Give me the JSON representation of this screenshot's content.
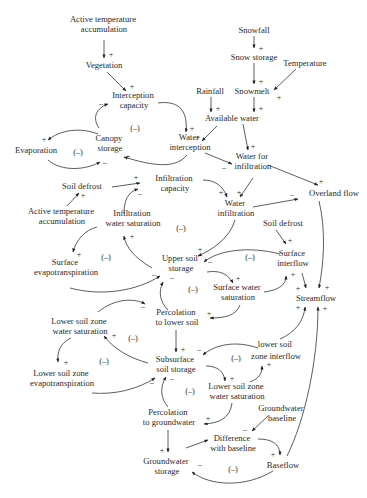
{
  "diagram": {
    "type": "causal-loop-diagram",
    "nodes": {
      "active_temp_top": [
        "Active temperature",
        "accumulation"
      ],
      "vegetation": [
        "Vegetation"
      ],
      "interception_capacity": [
        "Interception",
        "capacity"
      ],
      "snowfall": [
        "Snowfall"
      ],
      "snow_storage": [
        "Snow storage"
      ],
      "temperature": [
        "Temperature"
      ],
      "rainfall": [
        "Rainfall"
      ],
      "snowmelt": [
        "Snowmelt"
      ],
      "available_water": [
        "Available water"
      ],
      "water_interception": [
        "Water",
        "interception"
      ],
      "canopy_storage": [
        "Canopy",
        "storage"
      ],
      "evaporation": [
        "Evaporation"
      ],
      "water_for_infiltration": [
        "Water for",
        "infiltration"
      ],
      "overland_flow": [
        "Overland flow"
      ],
      "soil_defrost_left": [
        "Soil defrost"
      ],
      "infiltration_capacity": [
        "Infiltration",
        "capacity"
      ],
      "water_infiltration": [
        "Water",
        "infiltration"
      ],
      "active_temp_mid": [
        "Active temperature",
        "accumulation"
      ],
      "infiltration_water_saturation": [
        "Infiltration",
        "water saturation"
      ],
      "soil_defrost_right": [
        "Soil defrost"
      ],
      "surface_evapotranspiration": [
        "Surface",
        "evapotranspiration"
      ],
      "upper_soil_storage": [
        "Upper soil",
        "storage"
      ],
      "surface_interflow": [
        "Surface",
        "interflow"
      ],
      "surface_water_saturation": [
        "Surface water",
        "saturation"
      ],
      "streamflow": [
        "Streamflow"
      ],
      "percolation_lower_soil": [
        "Percolation",
        "to lower soil"
      ],
      "lower_soil_zone_water_saturation_left": [
        "Lower soil zone",
        "water saturation"
      ],
      "lower_soil_zone_interflow": [
        "lower soil",
        "zone interflow"
      ],
      "subsurface_soil_storage": [
        "Subsurface",
        "soil storage"
      ],
      "lower_soil_zone_evapotranspiration": [
        "Lower soil zone",
        "evapotranspiration"
      ],
      "lower_soil_zone_water_saturation_right": [
        "Lower soil zone",
        "water saturation"
      ],
      "groundwater_baseline": [
        "Groundwater",
        "baseline"
      ],
      "percolation_groundwater": [
        "Percolation",
        "to groundwater"
      ],
      "difference_with_baseline": [
        "Difference",
        "with baseline"
      ],
      "groundwater_storage": [
        "Groundwater",
        "storage"
      ],
      "baseflow": [
        "Baseflow"
      ]
    },
    "signs": {
      "plus": "+",
      "minus": "–"
    },
    "loop_label": "(–)",
    "edges": [
      {
        "from": "Active temperature accumulation",
        "to": "Vegetation",
        "sign": "+"
      },
      {
        "from": "Vegetation",
        "to": "Interception capacity",
        "sign": "+"
      },
      {
        "from": "Snowfall",
        "to": "Snow storage",
        "sign": "+"
      },
      {
        "from": "Snow storage",
        "to": "Snowmelt",
        "sign": "+"
      },
      {
        "from": "Temperature",
        "to": "Snowmelt",
        "sign": "+"
      },
      {
        "from": "Rainfall",
        "to": "Available water",
        "sign": "+"
      },
      {
        "from": "Snowmelt",
        "to": "Available water",
        "sign": "+"
      },
      {
        "from": "Interception capacity",
        "to": "Water interception",
        "sign": "+"
      },
      {
        "from": "Available water",
        "to": "Water interception",
        "sign": "+"
      },
      {
        "from": "Available water",
        "to": "Water for infiltration",
        "sign": "+"
      },
      {
        "from": "Water interception",
        "to": "Canopy storage",
        "sign": "+"
      },
      {
        "from": "Water interception",
        "to": "Water for infiltration",
        "sign": "–"
      },
      {
        "from": "Canopy storage",
        "to": "Interception capacity",
        "sign": "–"
      },
      {
        "from": "Canopy storage",
        "to": "Evaporation",
        "sign": "+"
      },
      {
        "from": "Evaporation",
        "to": "Canopy storage",
        "sign": "–"
      },
      {
        "from": "Water for infiltration",
        "to": "Overland flow",
        "sign": "+"
      },
      {
        "from": "Water for infiltration",
        "to": "Water infiltration",
        "sign": "+"
      },
      {
        "from": "Infiltration capacity",
        "to": "Water infiltration",
        "sign": "+"
      },
      {
        "from": "Soil defrost",
        "to": "Infiltration capacity",
        "sign": "+"
      },
      {
        "from": "Active temperature accumulation",
        "to": "Soil defrost",
        "sign": "+"
      },
      {
        "from": "Water infiltration",
        "to": "Overland flow",
        "sign": "–"
      },
      {
        "from": "Water infiltration",
        "to": "Upper soil storage",
        "sign": "+"
      },
      {
        "from": "Infiltration water saturation",
        "to": "Infiltration capacity",
        "sign": "–"
      },
      {
        "from": "Upper soil storage",
        "to": "Infiltration water saturation",
        "sign": "+"
      },
      {
        "from": "Infiltration water saturation",
        "to": "Surface evapotranspiration",
        "sign": "+"
      },
      {
        "from": "Surface evapotranspiration",
        "to": "Upper soil storage",
        "sign": "–"
      },
      {
        "from": "Soil defrost",
        "to": "Surface interflow",
        "sign": "+"
      },
      {
        "from": "Surface interflow",
        "to": "Upper soil storage",
        "sign": "–"
      },
      {
        "from": "Upper soil storage",
        "to": "Surface water saturation",
        "sign": "+"
      },
      {
        "from": "Surface water saturation",
        "to": "Surface interflow",
        "sign": "+"
      },
      {
        "from": "Surface water saturation",
        "to": "Percolation to lower soil",
        "sign": "+"
      },
      {
        "from": "Percolation to lower soil",
        "to": "Upper soil storage",
        "sign": "–"
      },
      {
        "from": "Surface interflow",
        "to": "Streamflow",
        "sign": "+"
      },
      {
        "from": "Overland flow",
        "to": "Streamflow",
        "sign": "+"
      },
      {
        "from": "Percolation to lower soil",
        "to": "Subsurface soil storage",
        "sign": "+"
      },
      {
        "from": "Lower soil zone water saturation",
        "to": "Percolation to lower soil",
        "sign": "–"
      },
      {
        "from": "Subsurface soil storage",
        "to": "Lower soil zone water saturation",
        "sign": "+"
      },
      {
        "from": "Lower soil zone water saturation",
        "to": "Lower soil zone evapotranspiration",
        "sign": "+"
      },
      {
        "from": "Lower soil zone evapotranspiration",
        "to": "Subsurface soil storage",
        "sign": "–"
      },
      {
        "from": "lower soil zone interflow",
        "to": "Subsurface soil storage",
        "sign": "–"
      },
      {
        "from": "lower soil zone interflow",
        "to": "Streamflow",
        "sign": "+"
      },
      {
        "from": "Subsurface soil storage",
        "to": "Lower soil zone water saturation (right)",
        "sign": "+"
      },
      {
        "from": "Lower soil zone water saturation (right)",
        "to": "lower soil zone interflow",
        "sign": "+"
      },
      {
        "from": "Lower soil zone water saturation (right)",
        "to": "Percolation to groundwater",
        "sign": "+"
      },
      {
        "from": "Percolation to groundwater",
        "to": "Subsurface soil storage",
        "sign": "–"
      },
      {
        "from": "Percolation to groundwater",
        "to": "Groundwater storage",
        "sign": "+"
      },
      {
        "from": "Groundwater baseline",
        "to": "Difference with baseline",
        "sign": "–"
      },
      {
        "from": "Groundwater storage",
        "to": "Difference with baseline",
        "sign": "+"
      },
      {
        "from": "Difference with baseline",
        "to": "Baseflow",
        "sign": "+"
      },
      {
        "from": "Baseflow",
        "to": "Groundwater storage",
        "sign": "–"
      },
      {
        "from": "Baseflow",
        "to": "Streamflow",
        "sign": "+"
      }
    ]
  }
}
